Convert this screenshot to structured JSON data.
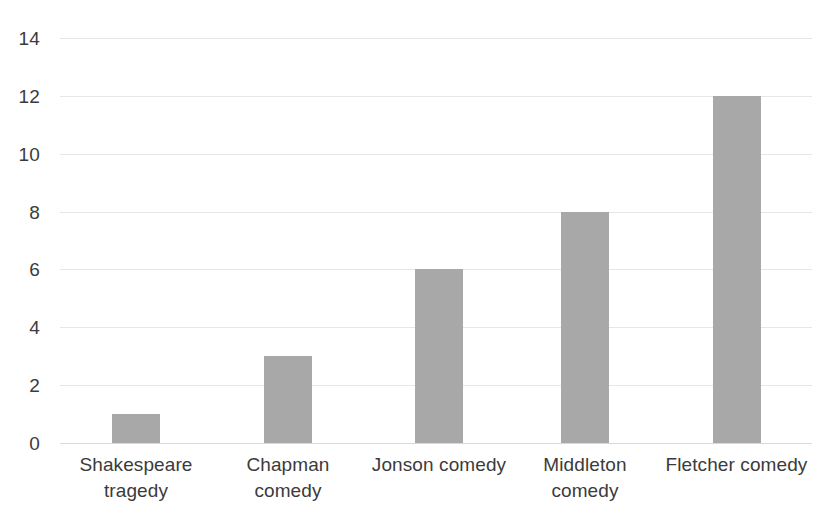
{
  "chart_data": {
    "type": "bar",
    "title": "",
    "subtitle": "",
    "xlabel": "",
    "ylabel": "",
    "categories": [
      "Shakespeare tragedy",
      "Chapman comedy",
      "Jonson comedy",
      "Middleton comedy",
      "Fletcher comedy"
    ],
    "values": [
      1,
      3,
      6,
      8,
      12
    ],
    "ylim": [
      0,
      14
    ],
    "ytick_labels": [
      "0",
      "2",
      "4",
      "6",
      "8",
      "10",
      "12",
      "14"
    ],
    "ytick_values": [
      0,
      2,
      4,
      6,
      8,
      10,
      12,
      14
    ],
    "grid": true,
    "grid_axis": "y",
    "legend": false,
    "legend_position": "none",
    "colors": {
      "bar": "#a8a8a8",
      "gridline": "#e6e6e6",
      "baseline": "#d9d9d9",
      "text": "#3b3b3b",
      "background": "#ffffff"
    }
  }
}
